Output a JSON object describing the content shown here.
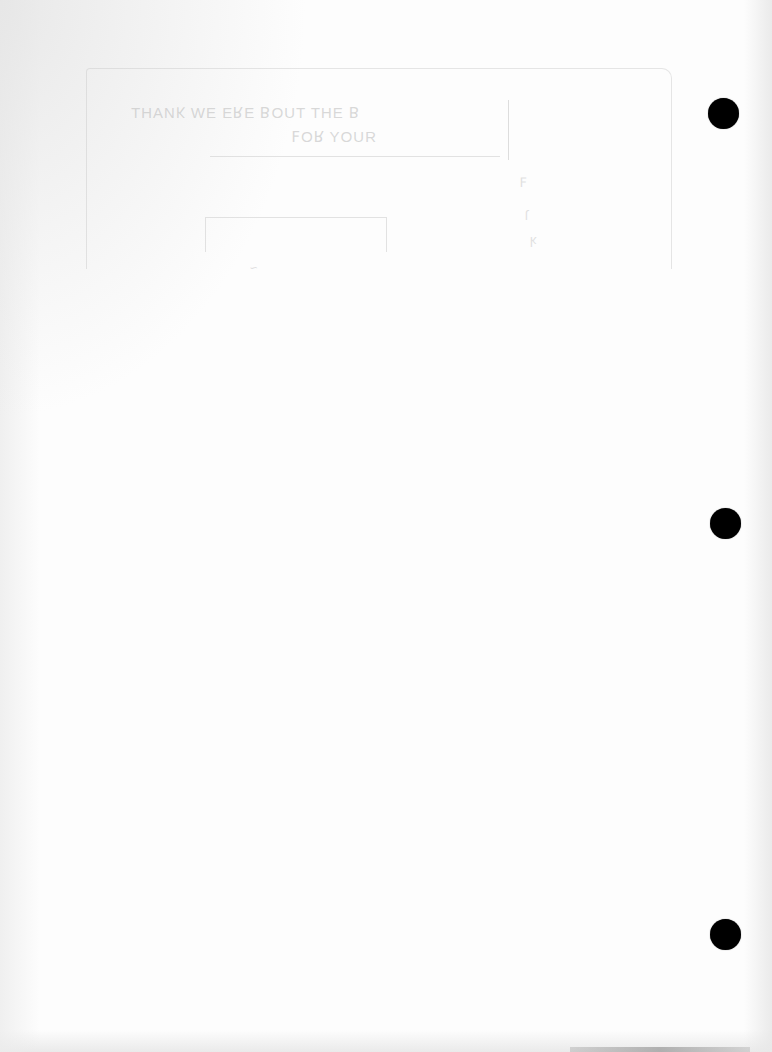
{
  "document": {
    "type": "scanned-page",
    "content": "blank",
    "background_color": "#fdfdfd"
  },
  "bleed_through": {
    "description": "faint mirrored text visible from reverse side (illegible)",
    "line1": "ꓭ  ƎHT  TUOꓭ  ƎꓤƎ  ƎW  ʞИAHT",
    "line2": "ЯUOY  ꓤOꟻ",
    "marks": [
      "ꟻ",
      "ɿ",
      "ʞ",
      "~"
    ]
  },
  "binder_holes": {
    "count": 3,
    "color": "#000000",
    "positions": [
      "top",
      "middle",
      "bottom"
    ]
  }
}
